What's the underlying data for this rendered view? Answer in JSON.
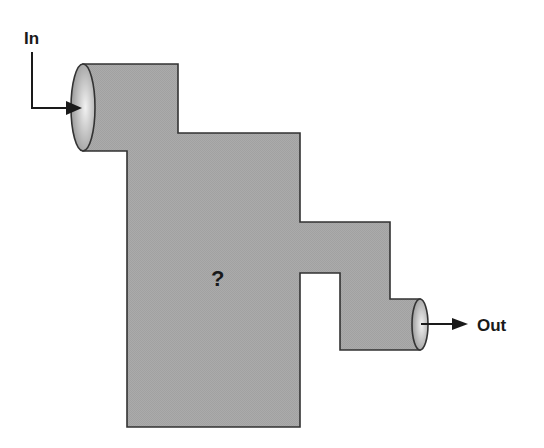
{
  "diagram": {
    "inlet_label": "In",
    "outlet_label": "Out",
    "center_label": "?",
    "colors": {
      "outline": "#333333",
      "fill_dark": "#8a8a8a",
      "fill_light": "#dcdcdc",
      "fill_bottom": "#b4b4b4",
      "arrow": "#1a1a1a",
      "background": "#ffffff"
    }
  }
}
